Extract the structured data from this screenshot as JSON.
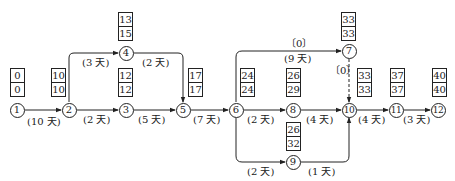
{
  "diagram": {
    "type": "network-schedule",
    "nodes": [
      {
        "id": "1",
        "label": "1",
        "x": 17,
        "y": 110
      },
      {
        "id": "2",
        "label": "2",
        "x": 69,
        "y": 110
      },
      {
        "id": "3",
        "label": "3",
        "x": 126,
        "y": 110
      },
      {
        "id": "4",
        "label": "4",
        "x": 126,
        "y": 53
      },
      {
        "id": "5",
        "label": "5",
        "x": 183,
        "y": 110
      },
      {
        "id": "6",
        "label": "6",
        "x": 236,
        "y": 110
      },
      {
        "id": "7",
        "label": "7",
        "x": 349,
        "y": 51
      },
      {
        "id": "8",
        "label": "8",
        "x": 293,
        "y": 110
      },
      {
        "id": "9",
        "label": "9",
        "x": 293,
        "y": 162
      },
      {
        "id": "10",
        "label": "10",
        "x": 349,
        "y": 110
      },
      {
        "id": "11",
        "label": "11",
        "x": 396,
        "y": 110
      },
      {
        "id": "12",
        "label": "12",
        "x": 438,
        "y": 110
      }
    ],
    "time_boxes": [
      {
        "node": "1",
        "top": "0",
        "bottom": "0",
        "x": 10,
        "y": 68
      },
      {
        "node": "2",
        "top": "10",
        "bottom": "10",
        "x": 51,
        "y": 68
      },
      {
        "node": "3",
        "top": "12",
        "bottom": "12",
        "x": 118,
        "y": 68
      },
      {
        "node": "4",
        "top": "13",
        "bottom": "15",
        "x": 118,
        "y": 12
      },
      {
        "node": "5",
        "top": "17",
        "bottom": "17",
        "x": 188,
        "y": 68
      },
      {
        "node": "6",
        "top": "24",
        "bottom": "24",
        "x": 240,
        "y": 68
      },
      {
        "node": "8",
        "top": "26",
        "bottom": "29",
        "x": 286,
        "y": 68
      },
      {
        "node": "9",
        "top": "26",
        "bottom": "32",
        "x": 286,
        "y": 122
      },
      {
        "node": "7",
        "top": "33",
        "bottom": "33",
        "x": 341,
        "y": 12
      },
      {
        "node": "10",
        "top": "33",
        "bottom": "33",
        "x": 357,
        "y": 68
      },
      {
        "node": "11",
        "top": "37",
        "bottom": "37",
        "x": 390,
        "y": 68
      },
      {
        "node": "12",
        "top": "40",
        "bottom": "40",
        "x": 432,
        "y": 68
      }
    ],
    "activity_labels": [
      {
        "text": "(10 天)",
        "x": 27,
        "y": 117
      },
      {
        "text": "(3 天)",
        "x": 82,
        "y": 58
      },
      {
        "text": "(2 天)",
        "x": 83,
        "y": 115
      },
      {
        "text": "(2 天)",
        "x": 142,
        "y": 58
      },
      {
        "text": "(5 天)",
        "x": 138,
        "y": 115
      },
      {
        "text": "(7 天)",
        "x": 193,
        "y": 115
      },
      {
        "text": "〔0〕",
        "x": 286,
        "y": 39
      },
      {
        "text": "(9 天)",
        "x": 284,
        "y": 54
      },
      {
        "text": "(2 天)",
        "x": 247,
        "y": 115
      },
      {
        "text": "〔0〕",
        "x": 330,
        "y": 66
      },
      {
        "text": "(4 天)",
        "x": 306,
        "y": 115
      },
      {
        "text": "(2 天)",
        "x": 247,
        "y": 167
      },
      {
        "text": "(1 天)",
        "x": 308,
        "y": 167
      },
      {
        "text": "(4 天)",
        "x": 358,
        "y": 115
      },
      {
        "text": "(3 天)",
        "x": 403,
        "y": 115
      }
    ],
    "edges": [
      {
        "from": "1",
        "to": "2",
        "duration": "10 天"
      },
      {
        "from": "2",
        "to": "4",
        "duration": "3 天"
      },
      {
        "from": "2",
        "to": "3",
        "duration": "2 天"
      },
      {
        "from": "4",
        "to": "5",
        "duration": "2 天"
      },
      {
        "from": "3",
        "to": "5",
        "duration": "5 天"
      },
      {
        "from": "5",
        "to": "6",
        "duration": "7 天"
      },
      {
        "from": "6",
        "to": "7",
        "duration": "9 天",
        "float": "0"
      },
      {
        "from": "6",
        "to": "8",
        "duration": "2 天"
      },
      {
        "from": "6",
        "to": "9",
        "duration": "2 天"
      },
      {
        "from": "7",
        "to": "10",
        "duration": "dummy",
        "float": "0",
        "dashed": true
      },
      {
        "from": "8",
        "to": "10",
        "duration": "4 天"
      },
      {
        "from": "9",
        "to": "10",
        "duration": "1 天"
      },
      {
        "from": "10",
        "to": "11",
        "duration": "4 天"
      },
      {
        "from": "11",
        "to": "12",
        "duration": "3 天"
      }
    ],
    "colors": {
      "line": "#222222",
      "background": "#ffffff"
    }
  }
}
